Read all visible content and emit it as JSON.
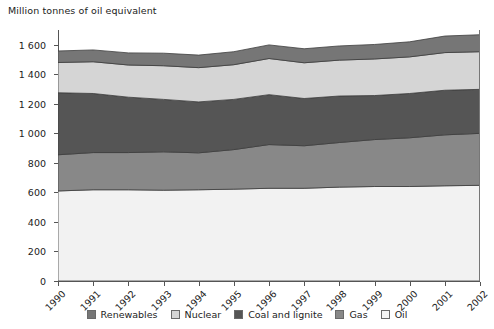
{
  "chart_data": {
    "type": "area",
    "title": "Million tonnes of oil equivalent",
    "xlabel": "",
    "ylabel": "Million tonnes of oil equivalent",
    "stacked": true,
    "grid": false,
    "legend_position": "bottom",
    "ylim": [
      0,
      1700
    ],
    "yticks": [
      0,
      200,
      400,
      600,
      800,
      1000,
      1200,
      1400,
      1600
    ],
    "ytick_labels": [
      "0",
      "200",
      "400",
      "600",
      "800",
      "1 000",
      "1 200",
      "1 400",
      "1 600"
    ],
    "categories": [
      "1990",
      "1991",
      "1992",
      "1993",
      "1994",
      "1995",
      "1996",
      "1997",
      "1998",
      "1999",
      "2000",
      "2001",
      "2002"
    ],
    "series": [
      {
        "name": "Oil",
        "color": "#f2f2f2",
        "values": [
          610,
          618,
          618,
          615,
          618,
          622,
          628,
          628,
          636,
          640,
          640,
          645,
          648
        ]
      },
      {
        "name": "Gas",
        "color": "#888888",
        "values": [
          245,
          252,
          252,
          260,
          250,
          268,
          296,
          288,
          302,
          318,
          330,
          345,
          352
        ]
      },
      {
        "name": "Coal and lignite",
        "color": "#555555",
        "values": [
          420,
          400,
          375,
          355,
          345,
          340,
          338,
          320,
          315,
          298,
          300,
          302,
          298
        ]
      },
      {
        "name": "Nuclear",
        "color": "#d5d5d5",
        "values": [
          205,
          215,
          218,
          228,
          232,
          235,
          245,
          242,
          243,
          248,
          248,
          255,
          255
        ]
      },
      {
        "name": "Renewables",
        "color": "#767676",
        "values": [
          78,
          80,
          82,
          85,
          85,
          88,
          92,
          95,
          96,
          98,
          102,
          112,
          115
        ]
      }
    ],
    "totals": [
      1558,
      1565,
      1545,
      1543,
      1530,
      1553,
      1599,
      1573,
      1592,
      1602,
      1620,
      1659,
      1668
    ],
    "legend": [
      {
        "label": "Renewables",
        "color": "#767676"
      },
      {
        "label": "Nuclear",
        "color": "#d5d5d5"
      },
      {
        "label": "Coal and lignite",
        "color": "#555555"
      },
      {
        "label": "Gas",
        "color": "#888888"
      },
      {
        "label": "Oil",
        "color": "#f5f5f5"
      }
    ]
  }
}
